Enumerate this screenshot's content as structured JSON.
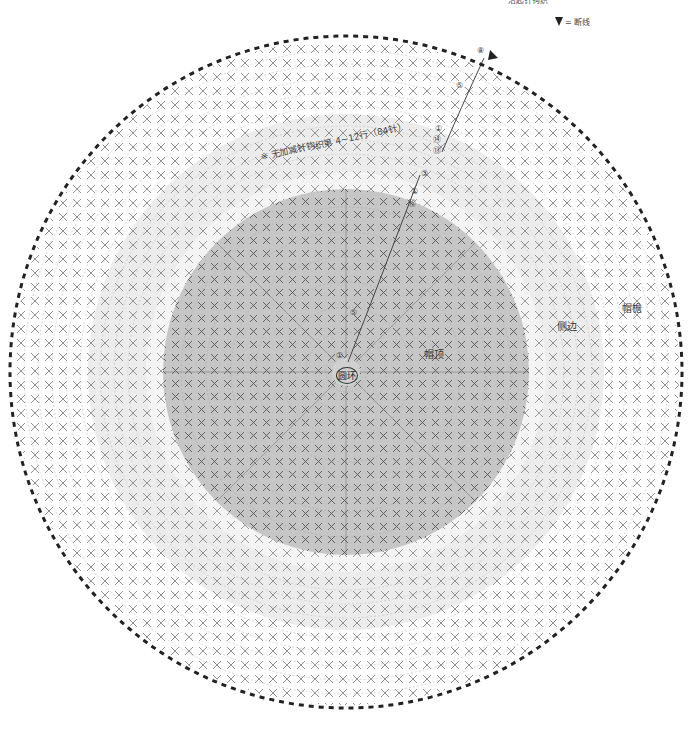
{
  "header": {
    "top_note": "沿起针钩织",
    "legend": {
      "symbol": "triangle-fill-down",
      "label": "= 断线"
    }
  },
  "labels": {
    "brim": "帽檐",
    "side": "侧边",
    "crown": "帽顶",
    "center_ring": "圆环",
    "side_note": "※ 无加减针钩织第 4~12行（84针）"
  },
  "row_markers": {
    "brim": [
      "⑧",
      "⑤",
      "①"
    ],
    "side": [
      "⑭",
      "⑬",
      "③",
      "①"
    ],
    "crown": [
      "⑮",
      "⑩",
      "⑤",
      "①"
    ]
  },
  "chart": {
    "center": [
      346,
      372
    ],
    "outer_radius": 335,
    "brim_inner_radius": 258,
    "side_outer_radius": 258,
    "side_inner_radius": 200,
    "crown_radius": 183,
    "colors": {
      "background": "#ffffff",
      "brim": "#ffffff",
      "side": "#ececec",
      "gap": "#f6f6f6",
      "crown": "#c6c6c6",
      "stitch": "#555555",
      "edge_dash": "#222222"
    },
    "stitch_symbols": [
      "X (短针)",
      "V (加针)",
      "A (减针)"
    ]
  }
}
